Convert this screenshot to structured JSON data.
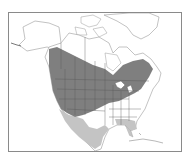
{
  "map": {
    "type": "species range map",
    "region": "North America",
    "caption": "",
    "colors": {
      "background": "#ffffff",
      "land_outline": "#9a9a9a",
      "frame": "#8a8a8a",
      "breeding_range": "#7f7f7f",
      "winter_range": "#c4c4c4",
      "boundaries": "#555555"
    },
    "legend": {
      "layers": [
        {
          "name": "year-round / breeding range",
          "color": "#7f7f7f"
        },
        {
          "name": "winter range",
          "color": "#c4c4c4"
        }
      ]
    }
  }
}
